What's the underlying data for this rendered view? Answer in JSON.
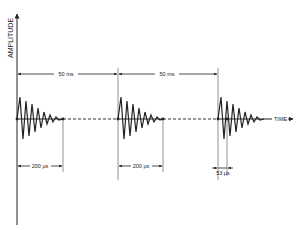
{
  "diagram": {
    "type": "timing-diagram",
    "y_axis_label": "AMPLITUDE",
    "x_axis_label": "TIME",
    "period_label_1": "50 ms",
    "period_label_2": "50 ms",
    "burst_duration_label_1": "200 μs",
    "burst_duration_label_2": "200 μs",
    "cycle_label": "53 μs",
    "colors": {
      "ink": "#222222",
      "background": "#ffffff",
      "guide": "#777777"
    },
    "bursts": [
      {
        "index": 1,
        "start_label": "t0",
        "duration": "200 μs"
      },
      {
        "index": 2,
        "start_label": "t0 + 50 ms",
        "duration": "200 μs"
      },
      {
        "index": 3,
        "start_label": "t0 + 100 ms",
        "cycle": "53 μs"
      }
    ]
  }
}
